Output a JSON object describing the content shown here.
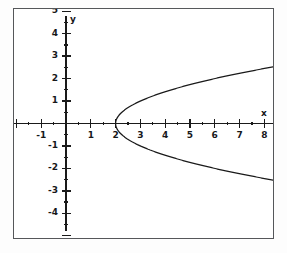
{
  "figure": {
    "background": "#fdfdfd",
    "frame_color": "#55575a",
    "curve_color": "#1a1a1a",
    "axis_color": "#1a1a1a",
    "x_axis_name": "x",
    "y_axis_name": "y"
  },
  "chart_data": {
    "type": "line",
    "title": "",
    "xlabel": "x",
    "ylabel": "y",
    "xlim": [
      -2.1,
      8.35
    ],
    "ylim": [
      -5.1,
      5.1
    ],
    "grid": false,
    "legend": null,
    "equation": "y^2 = x - 2",
    "vertex": [
      2,
      0
    ],
    "opens": "right",
    "x_ticks": [
      -1,
      1,
      2,
      3,
      4,
      5,
      6,
      7,
      8
    ],
    "x_tick_labels": [
      "-1",
      "1",
      "2",
      "3",
      "4",
      "5",
      "6",
      "7",
      "8"
    ],
    "y_ticks": [
      -4,
      -3,
      -2,
      -1,
      1,
      2,
      3,
      4,
      5
    ],
    "y_tick_labels": [
      "-4",
      "-3",
      "-2",
      "-1",
      "1",
      "2",
      "3",
      "4",
      "5"
    ],
    "x_minor_step": 0.5,
    "y_minor_step": 0.5,
    "series": [
      {
        "name": "upper branch",
        "points": [
          [
            2,
            0
          ],
          [
            2.06,
            0.245
          ],
          [
            2.25,
            0.5
          ],
          [
            2.56,
            0.75
          ],
          [
            3,
            1
          ],
          [
            3.56,
            1.25
          ],
          [
            4.25,
            1.5
          ],
          [
            5.06,
            1.75
          ],
          [
            6,
            2
          ],
          [
            7.06,
            2.25
          ],
          [
            8.25,
            2.5
          ]
        ]
      },
      {
        "name": "lower branch",
        "points": [
          [
            2,
            0
          ],
          [
            2.06,
            -0.245
          ],
          [
            2.25,
            -0.5
          ],
          [
            2.56,
            -0.75
          ],
          [
            3,
            -1
          ],
          [
            3.56,
            -1.25
          ],
          [
            4.25,
            -1.5
          ],
          [
            5.06,
            -1.75
          ],
          [
            6,
            -2
          ],
          [
            7.06,
            -2.25
          ],
          [
            8.25,
            -2.5
          ]
        ]
      }
    ]
  }
}
